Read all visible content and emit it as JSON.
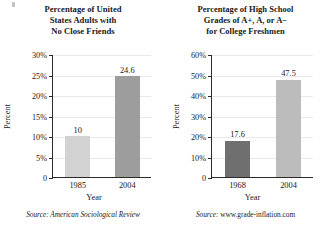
{
  "chart_data": [
    {
      "type": "bar",
      "title": "Percentage of United States Adults with No Close Friends",
      "title_lines": [
        "Percentage of United",
        "States Adults with",
        "No Close Friends"
      ],
      "categories": [
        "1985",
        "2004"
      ],
      "values": [
        10,
        24.6
      ],
      "value_labels": [
        "10",
        "24.6"
      ],
      "bar_colors": [
        "#d2d2d2",
        "#9d9d9d"
      ],
      "xlabel": "Year",
      "ylabel": "Percent",
      "ylim": [
        0,
        30
      ],
      "ytick_values": [
        0,
        5,
        10,
        15,
        20,
        25,
        30
      ],
      "ytick_labels": [
        "0",
        "5%",
        "10%",
        "15%",
        "20%",
        "25%",
        "30%"
      ],
      "grid": true,
      "legend": "none",
      "source_prefix": "Source:",
      "source_text": " American Sociological Review",
      "source_italic": true
    },
    {
      "type": "bar",
      "title": "Percentage of High School Grades of A+, A, or A− for College Freshmen",
      "title_lines": [
        "Percentage of High School",
        "Grades of A+, A, or A−",
        "for College Freshmen"
      ],
      "categories": [
        "1968",
        "2004"
      ],
      "values": [
        17.6,
        47.5
      ],
      "value_labels": [
        "17.6",
        "47.5"
      ],
      "bar_colors": [
        "#6f6f6f",
        "#bcbcbc"
      ],
      "xlabel": "Year",
      "ylabel": "Percent",
      "ylim": [
        0,
        60
      ],
      "ytick_values": [
        0,
        10,
        20,
        30,
        40,
        50,
        60
      ],
      "ytick_labels": [
        "0",
        "10%",
        "20%",
        "30%",
        "40%",
        "50%",
        "60%"
      ],
      "grid": true,
      "legend": "none",
      "source_prefix": "Source:",
      "source_text": " www.grade-inflation.com",
      "source_italic": false
    }
  ]
}
